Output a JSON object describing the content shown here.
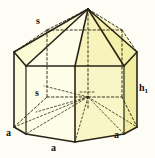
{
  "figure": {
    "background_color": "#fdfdf5",
    "colors": {
      "face_light": "#fbfbdc",
      "face_mid": "#f7f5c0",
      "face_strong": "#f2efa0",
      "face_top_light": "#fcfce0",
      "edge": "#2a2418",
      "hidden_edge": "#3a3220"
    },
    "labels": {
      "slant_top": "s",
      "slant_inner": "s",
      "height_right": "h",
      "height_right_sub": "1",
      "base_left": "a",
      "base_center": "a",
      "base_right": "a"
    }
  }
}
